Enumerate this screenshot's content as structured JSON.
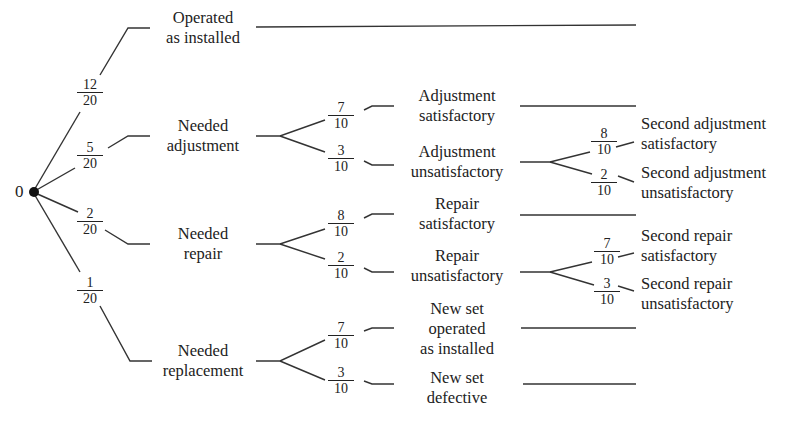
{
  "root": {
    "label": "0"
  },
  "level1": [
    {
      "label_lines": [
        "Operated",
        "as installed"
      ],
      "prob": {
        "num": "12",
        "den": "20"
      }
    },
    {
      "label_lines": [
        "Needed",
        "adjustment"
      ],
      "prob": {
        "num": "5",
        "den": "20"
      }
    },
    {
      "label_lines": [
        "Needed",
        "repair"
      ],
      "prob": {
        "num": "2",
        "den": "20"
      }
    },
    {
      "label_lines": [
        "Needed",
        "replacement"
      ],
      "prob": {
        "num": "1",
        "den": "20"
      }
    }
  ],
  "adjustment_branch": [
    {
      "label_lines": [
        "Adjustment",
        "satisfactory"
      ],
      "prob": {
        "num": "7",
        "den": "10"
      }
    },
    {
      "label_lines": [
        "Adjustment",
        "unsatisfactory"
      ],
      "prob": {
        "num": "3",
        "den": "10"
      }
    }
  ],
  "second_adjustment_branch": [
    {
      "label_lines": [
        "Second adjustment",
        "satisfactory"
      ],
      "prob": {
        "num": "8",
        "den": "10"
      }
    },
    {
      "label_lines": [
        "Second adjustment",
        "unsatisfactory"
      ],
      "prob": {
        "num": "2",
        "den": "10"
      }
    }
  ],
  "repair_branch": [
    {
      "label_lines": [
        "Repair",
        "satisfactory"
      ],
      "prob": {
        "num": "8",
        "den": "10"
      }
    },
    {
      "label_lines": [
        "Repair",
        "unsatisfactory"
      ],
      "prob": {
        "num": "2",
        "den": "10"
      }
    }
  ],
  "second_repair_branch": [
    {
      "label_lines": [
        "Second repair",
        "satisfactory"
      ],
      "prob": {
        "num": "7",
        "den": "10"
      }
    },
    {
      "label_lines": [
        "Second repair",
        "unsatisfactory"
      ],
      "prob": {
        "num": "3",
        "den": "10"
      }
    }
  ],
  "replacement_branch": [
    {
      "label_lines": [
        "New set",
        "operated",
        "as installed"
      ],
      "prob": {
        "num": "7",
        "den": "10"
      }
    },
    {
      "label_lines": [
        "New set",
        "defective"
      ],
      "prob": {
        "num": "3",
        "den": "10"
      }
    }
  ]
}
